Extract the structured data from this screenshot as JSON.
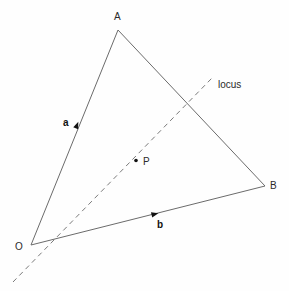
{
  "figure": {
    "background_color": "#fefefe",
    "width": 289,
    "height": 291
  },
  "style": {
    "solid_line_color": "#6b6b6b",
    "dashed_line_color": "#7a7a7a",
    "text_color": "#2b2b2b",
    "marker_color": "#111111",
    "solid_line_width": 1,
    "dashed_line_width": 1,
    "dash_pattern": "5,4"
  },
  "labels": {
    "vertex_a": "A",
    "vertex_b": "B",
    "vertex_o": "O",
    "point_p": "P",
    "vector_a": "a",
    "vector_b": "b",
    "locus": "locus"
  },
  "chart_data": {
    "type": "scatter",
    "xlabel": "",
    "ylabel": "",
    "xlim": [
      0,
      289
    ],
    "ylim": [
      291,
      0
    ],
    "grid": false,
    "legend": "none",
    "points": [
      {
        "name": "O",
        "label": "O",
        "x": 31,
        "y": 245
      },
      {
        "name": "A",
        "label": "A",
        "x": 118,
        "y": 30
      },
      {
        "name": "B",
        "label": "B",
        "x": 265,
        "y": 186
      },
      {
        "name": "P",
        "label": "P",
        "x": 135,
        "y": 160
      }
    ],
    "segments": [
      {
        "name": "OA",
        "style": "solid",
        "from": "O",
        "to": "A",
        "x1": 31,
        "y1": 245,
        "x2": 118,
        "y2": 30
      },
      {
        "name": "AB",
        "style": "solid",
        "from": "A",
        "to": "B",
        "x1": 118,
        "y1": 30,
        "x2": 265,
        "y2": 186
      },
      {
        "name": "OB",
        "style": "solid",
        "from": "O",
        "to": "B",
        "x1": 31,
        "y1": 245,
        "x2": 265,
        "y2": 186
      },
      {
        "name": "locus",
        "style": "dashed",
        "from": "",
        "to": "",
        "x1": 13,
        "y1": 282,
        "x2": 212,
        "y2": 78
      }
    ],
    "arrow_markers": [
      {
        "name": "vector-a-arrow",
        "on_segment": "OA",
        "x": 77,
        "y": 125
      },
      {
        "name": "vector-b-arrow",
        "on_segment": "OB",
        "x": 155,
        "y": 214
      }
    ],
    "annotations": [
      {
        "name": "vector-a-label",
        "text": "a",
        "x": 66,
        "y": 118,
        "bold": true
      },
      {
        "name": "vector-b-label",
        "text": "b",
        "x": 157,
        "y": 220,
        "bold": true
      },
      {
        "name": "locus-label",
        "text": "locus",
        "x": 218,
        "y": 80,
        "bold": false
      },
      {
        "name": "point-p-label",
        "text": "P",
        "x": 143,
        "y": 157,
        "bold": false
      },
      {
        "name": "vertex-a-label",
        "text": "A",
        "x": 114,
        "y": 12,
        "bold": false
      },
      {
        "name": "vertex-b-label",
        "text": "B",
        "x": 270,
        "y": 182,
        "bold": false
      },
      {
        "name": "vertex-o-label",
        "text": "O",
        "x": 15,
        "y": 242,
        "bold": false
      }
    ]
  }
}
